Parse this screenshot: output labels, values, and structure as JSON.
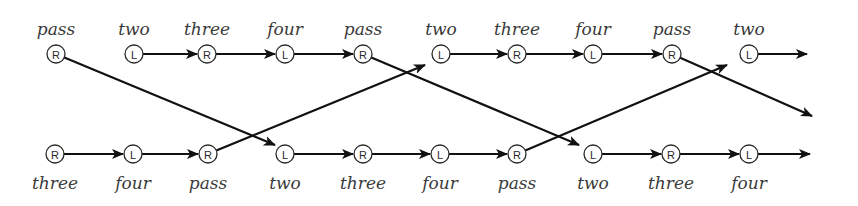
{
  "diagram": {
    "title": "",
    "node_radius": 9,
    "colors": {
      "stroke": "#111111",
      "text": "#3a3a3a",
      "background": "#ffffff"
    },
    "rows": {
      "top": {
        "y": 54,
        "label_y": 35,
        "nodes": [
          {
            "id": "t0",
            "x": 56,
            "type": "R",
            "label": "pass"
          },
          {
            "id": "t1",
            "x": 134,
            "type": "L",
            "label": "two"
          },
          {
            "id": "t2",
            "x": 207,
            "type": "R",
            "label": "three"
          },
          {
            "id": "t3",
            "x": 285,
            "type": "L",
            "label": "four"
          },
          {
            "id": "t4",
            "x": 363,
            "type": "R",
            "label": "pass"
          },
          {
            "id": "t5",
            "x": 441,
            "type": "L",
            "label": "two"
          },
          {
            "id": "t6",
            "x": 517,
            "type": "R",
            "label": "three"
          },
          {
            "id": "t7",
            "x": 593,
            "type": "L",
            "label": "four"
          },
          {
            "id": "t8",
            "x": 672,
            "type": "R",
            "label": "pass"
          },
          {
            "id": "t9",
            "x": 749,
            "type": "L",
            "label": "two"
          }
        ]
      },
      "bottom": {
        "y": 154,
        "label_y": 189,
        "nodes": [
          {
            "id": "b0",
            "x": 55,
            "type": "R",
            "label": "three"
          },
          {
            "id": "b1",
            "x": 133,
            "type": "L",
            "label": "four"
          },
          {
            "id": "b2",
            "x": 208,
            "type": "R",
            "label": "pass"
          },
          {
            "id": "b3",
            "x": 285,
            "type": "L",
            "label": "two"
          },
          {
            "id": "b4",
            "x": 363,
            "type": "R",
            "label": "three"
          },
          {
            "id": "b5",
            "x": 440,
            "type": "L",
            "label": "four"
          },
          {
            "id": "b6",
            "x": 517,
            "type": "R",
            "label": "pass"
          },
          {
            "id": "b7",
            "x": 593,
            "type": "L",
            "label": "two"
          },
          {
            "id": "b8",
            "x": 671,
            "type": "R",
            "label": "three"
          },
          {
            "id": "b9",
            "x": 749,
            "type": "L",
            "label": "four"
          }
        ]
      }
    },
    "edges": [
      {
        "from": "t1",
        "to": "t2"
      },
      {
        "from": "t2",
        "to": "t3"
      },
      {
        "from": "t3",
        "to": "t4"
      },
      {
        "from": "t5",
        "to": "t6"
      },
      {
        "from": "t6",
        "to": "t7"
      },
      {
        "from": "t7",
        "to": "t8"
      },
      {
        "from": "t9",
        "to_point": [
          807,
          54
        ]
      },
      {
        "from": "b0",
        "to": "b1"
      },
      {
        "from": "b1",
        "to": "b2"
      },
      {
        "from": "b3",
        "to": "b4"
      },
      {
        "from": "b4",
        "to": "b5"
      },
      {
        "from": "b5",
        "to": "b6"
      },
      {
        "from": "b7",
        "to": "b8"
      },
      {
        "from": "b8",
        "to": "b9"
      },
      {
        "from": "b9",
        "to_point": [
          810,
          154
        ]
      },
      {
        "from": "t0",
        "to_point": [
          275,
          145
        ],
        "cross": true
      },
      {
        "from": "b2",
        "to_point": [
          425,
          65
        ],
        "cross": true
      },
      {
        "from": "t4",
        "to_point": [
          579,
          145
        ],
        "cross": true
      },
      {
        "from": "b6",
        "to_point": [
          727,
          65
        ],
        "cross": true
      },
      {
        "from": "t8",
        "to_point": [
          812,
          116
        ],
        "cross": true
      }
    ]
  }
}
